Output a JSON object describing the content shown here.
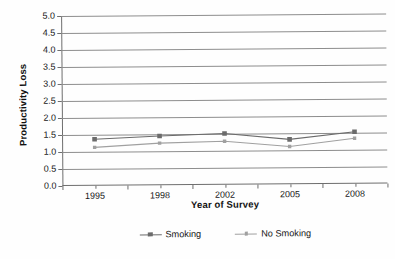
{
  "chart_data": {
    "type": "line",
    "title": "",
    "xlabel": "Year of Survey",
    "ylabel": "Productivity Loss",
    "categories": [
      "1995",
      "1998",
      "2002",
      "2005",
      "2008"
    ],
    "series": [
      {
        "name": "Smoking",
        "color": "#6b6b6b",
        "marker": "square",
        "values": [
          1.37,
          1.45,
          1.51,
          1.32,
          1.53
        ]
      },
      {
        "name": "No Smoking",
        "color": "#a0a0a0",
        "marker": "square-small",
        "values": [
          1.13,
          1.24,
          1.28,
          1.11,
          1.34
        ]
      }
    ],
    "ylim": [
      0.0,
      5.0
    ],
    "ytick_labels": [
      "0.0",
      "0.5",
      "1.0",
      "1.5",
      "2.0",
      "2.5",
      "3.0",
      "3.5",
      "4.0",
      "4.5",
      "5.0"
    ],
    "ytick_values": [
      0.0,
      0.5,
      1.0,
      1.5,
      2.0,
      2.5,
      3.0,
      3.5,
      4.0,
      4.5,
      5.0
    ],
    "grid": "horizontal",
    "legend_position": "bottom",
    "axis_color": "#6e6e6e",
    "grid_color": "#8d8d8d"
  }
}
